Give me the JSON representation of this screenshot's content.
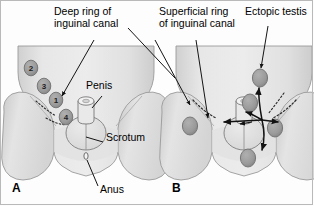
{
  "figure": {
    "title_implicit": "Descent of the testis and sites of ectopic testis",
    "panels": [
      {
        "letter": "A",
        "letter_x": 12,
        "letter_y": 183,
        "description": "Normal path of testicular descent with numbered stations 1-4",
        "callouts": [
          {
            "name": "deep-ring-label",
            "text": "Deep ring of\ninguinal canal",
            "x": 54,
            "y": 10
          },
          {
            "name": "penis-label",
            "text": "Penis",
            "x": 86,
            "y": 85
          },
          {
            "name": "scrotum-label",
            "text": "Scrotum",
            "x": 105,
            "y": 137
          },
          {
            "name": "anus-label",
            "text": "Anus",
            "x": 99,
            "y": 189
          }
        ],
        "stations": [
          {
            "label": "2",
            "x": 24,
            "y": 61
          },
          {
            "label": "3",
            "x": 38,
            "y": 79
          },
          {
            "label": "1",
            "x": 50,
            "y": 93
          },
          {
            "label": "4",
            "x": 59,
            "y": 110
          }
        ]
      },
      {
        "letter": "B",
        "letter_x": 172,
        "letter_y": 183,
        "description": "Sites of ectopic testis with arrows radiating from superficial ring",
        "callouts": [
          {
            "name": "superficial-ring-label",
            "text": "Superficial ring\nof inguinal canal",
            "x": 159,
            "y": 10
          },
          {
            "name": "ectopic-testis-label",
            "text": "Ectopic testis",
            "x": 247,
            "y": 10
          }
        ],
        "ectopic_sites": [
          {
            "name": "suprapubic-ectopic",
            "x": 243,
            "y": 100
          },
          {
            "name": "femoral-ectopic-left",
            "x": 188,
            "y": 123
          },
          {
            "name": "femoral-ectopic-right",
            "x": 270,
            "y": 125
          },
          {
            "name": "abdominal-ectopic",
            "x": 297,
            "y": 63
          },
          {
            "name": "perineal-ectopic",
            "x": 243,
            "y": 153
          }
        ]
      }
    ],
    "colors": {
      "body_fill": "#e3e3e3",
      "body_shade": "#d2d2d2",
      "body_highlight": "#efefef",
      "testis_fill": "#9a9a9a",
      "testis_stroke": "#6e6e6e",
      "outline": "#8c8c8c",
      "leader_line": "#1a1a1a",
      "text": "#000000",
      "frame": "#b9b9b9"
    }
  }
}
